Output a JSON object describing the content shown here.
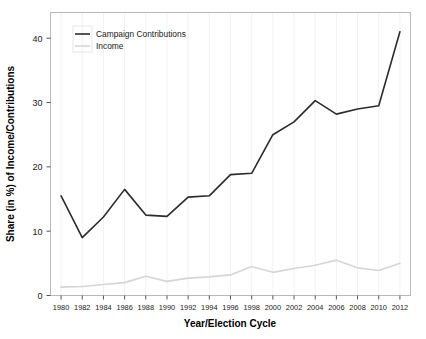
{
  "chart_data": {
    "type": "line",
    "title": "",
    "xlabel": "Year/Election Cycle",
    "ylabel": "Share (in %) of Income/Contributions",
    "xlim": [
      1979,
      2013
    ],
    "ylim": [
      0,
      44
    ],
    "yticks": [
      0,
      10,
      20,
      30,
      40
    ],
    "ytick_labels": [
      "0",
      "10",
      "20",
      "30",
      "40"
    ],
    "grid": true,
    "legend_position": "top-left",
    "x": [
      1980,
      1982,
      1984,
      1986,
      1988,
      1990,
      1992,
      1994,
      1996,
      1998,
      2000,
      2002,
      2004,
      2006,
      2008,
      2010,
      2012
    ],
    "xtick_labels": [
      "1980",
      "1982",
      "1984",
      "1986",
      "1988",
      "1990",
      "1992",
      "1994",
      "1996",
      "1998",
      "2000",
      "2002",
      "2004",
      "2006",
      "2008",
      "2010",
      "2012"
    ],
    "series": [
      {
        "name": "Campaign Contributions",
        "color": "#2b2b2b",
        "width": 1.6,
        "values": [
          15.5,
          9.0,
          12.2,
          16.5,
          12.5,
          12.3,
          15.3,
          15.5,
          18.8,
          19.0,
          25.0,
          27.0,
          30.3,
          28.2,
          29.0,
          29.5,
          41.0
        ]
      },
      {
        "name": "Income",
        "color": "#d6d6d6",
        "width": 1.6,
        "values": [
          1.3,
          1.4,
          1.7,
          2.0,
          3.0,
          2.2,
          2.7,
          2.9,
          3.2,
          4.5,
          3.6,
          4.2,
          4.7,
          5.5,
          4.3,
          3.9,
          5.0
        ]
      }
    ]
  },
  "legend": {
    "items": [
      {
        "label": "Campaign Contributions"
      },
      {
        "label": "Income"
      }
    ]
  },
  "colors": {
    "campaign_contributions": "#2b2b2b",
    "income": "#d6d6d6",
    "frame": "#b9b9b9",
    "grid": "#f2f2f2",
    "text": "#1a1a1a"
  }
}
